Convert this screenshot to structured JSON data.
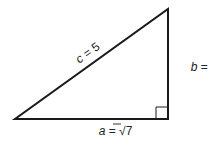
{
  "diagram": {
    "type": "right-triangle",
    "vertices": [
      {
        "x": 15,
        "y": 119
      },
      {
        "x": 168,
        "y": 119
      },
      {
        "x": 168,
        "y": 9
      }
    ],
    "right_angle_marker": {
      "x": 156,
      "y": 107,
      "size": 12
    },
    "stroke_color": "#1a1a1a",
    "labels": {
      "hypotenuse": {
        "var": "c",
        "eq": " = 5"
      },
      "vertical": {
        "var": "b",
        "eq": " = 3"
      },
      "base": {
        "var": "a",
        "eq": " = ",
        "root_symbol": "√",
        "radicand": "7"
      }
    }
  }
}
